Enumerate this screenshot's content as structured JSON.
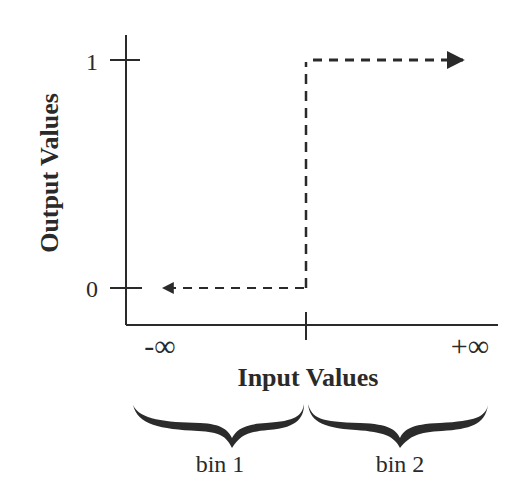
{
  "diagram": {
    "y_axis": {
      "label": "Output Values",
      "ticks": [
        "1",
        "0"
      ]
    },
    "x_axis": {
      "label": "Input Values",
      "left_label": "-∞",
      "right_label": "+∞"
    },
    "step": {
      "low_value": 0,
      "high_value": 1,
      "line_style": "dashed"
    },
    "bins": [
      {
        "label": "bin 1"
      },
      {
        "label": "bin 2"
      }
    ],
    "colors": {
      "line": "#2a2a2a",
      "brace": "#2b2b2b",
      "background": "#ffffff"
    }
  }
}
